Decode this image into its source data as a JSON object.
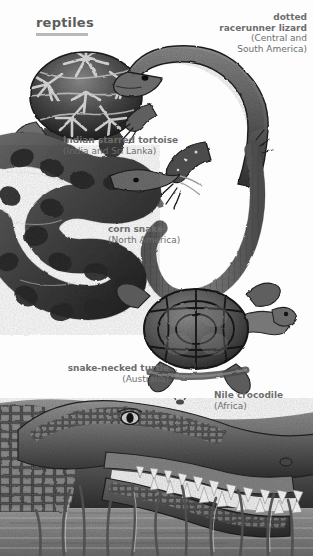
{
  "page": {
    "title": "reptiles",
    "background_color": "#fdfdfd",
    "text_color": "#6d6d6d",
    "title_color": "#5c5c5c",
    "rule_color": "#b9b9b9"
  },
  "captions": {
    "lizard": {
      "name": "dotted\nracerunner lizard",
      "name_line1": "dotted",
      "name_line2": "racerunner lizard",
      "region_line1": "(Central and",
      "region_line2": "South America)"
    },
    "tortoise": {
      "name": "Indian starred tortoise",
      "region": "(India and Sri Lanka)"
    },
    "snake": {
      "name": "corn snake",
      "region": "(North America)"
    },
    "turtle": {
      "name": "snake-necked turtle",
      "region": "(Australia)"
    },
    "crocodile": {
      "name": "Nile crocodile",
      "region": "(Africa)"
    }
  },
  "illustrations": [
    {
      "id": "indian-starred-tortoise",
      "label": "Indian starred tortoise",
      "description": "domed shell with radiating star pattern, head at lower left"
    },
    {
      "id": "dotted-racerunner-lizard",
      "label": "dotted racerunner lizard",
      "description": "spotted lizard with long U-curved scaly tail"
    },
    {
      "id": "corn-snake",
      "label": "corn snake",
      "description": "coiled blotched snake, head at upper right"
    },
    {
      "id": "snake-necked-turtle",
      "label": "snake-necked turtle",
      "description": "flat segmented shell seen from above with long neck"
    },
    {
      "id": "nile-crocodile",
      "label": "Nile crocodile",
      "description": "crocodile head with open toothed jaws among reeds in water"
    }
  ]
}
